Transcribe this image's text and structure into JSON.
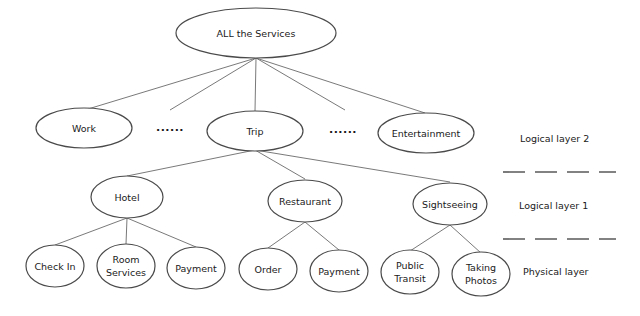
{
  "diagram": {
    "root": {
      "label": "ALL the Services"
    },
    "level2": [
      {
        "label": "Work"
      },
      {
        "label": "Trip"
      },
      {
        "label": "Entertainment"
      }
    ],
    "ellipsis_left": "......",
    "ellipsis_right": "......",
    "level1": [
      {
        "label": "Hotel"
      },
      {
        "label": "Restaurant"
      },
      {
        "label": "Sightseeing"
      }
    ],
    "physical": [
      {
        "line1": "Check In",
        "line2": ""
      },
      {
        "line1": "Room",
        "line2": "Services"
      },
      {
        "line1": "Payment",
        "line2": ""
      },
      {
        "line1": "Order",
        "line2": ""
      },
      {
        "line1": "Payment",
        "line2": ""
      },
      {
        "line1": "Public",
        "line2": "Transit"
      },
      {
        "line1": "Taking",
        "line2": "Photos"
      }
    ],
    "layers": {
      "logical2": "Logical layer 2",
      "logical1": "Logical layer 1",
      "physical": "Physical layer"
    }
  }
}
